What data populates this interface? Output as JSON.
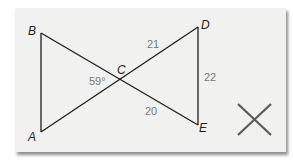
{
  "figure": {
    "vertices": {
      "A": {
        "label": "A"
      },
      "B": {
        "label": "B"
      },
      "C": {
        "label": "C"
      },
      "D": {
        "label": "D"
      },
      "E": {
        "label": "E"
      }
    },
    "measures": {
      "angle_ACB": "59°",
      "CD": "21",
      "DE": "22",
      "CE": "20"
    },
    "segments": [
      "AB",
      "BE",
      "AD",
      "DE"
    ],
    "intersection": "C",
    "verdict_mark": "X",
    "colors": {
      "card_background": "#f1f1f0",
      "line": "#1e1e1e",
      "measure_text": "#7a7a7a",
      "mark": "#5a5a5a"
    }
  }
}
